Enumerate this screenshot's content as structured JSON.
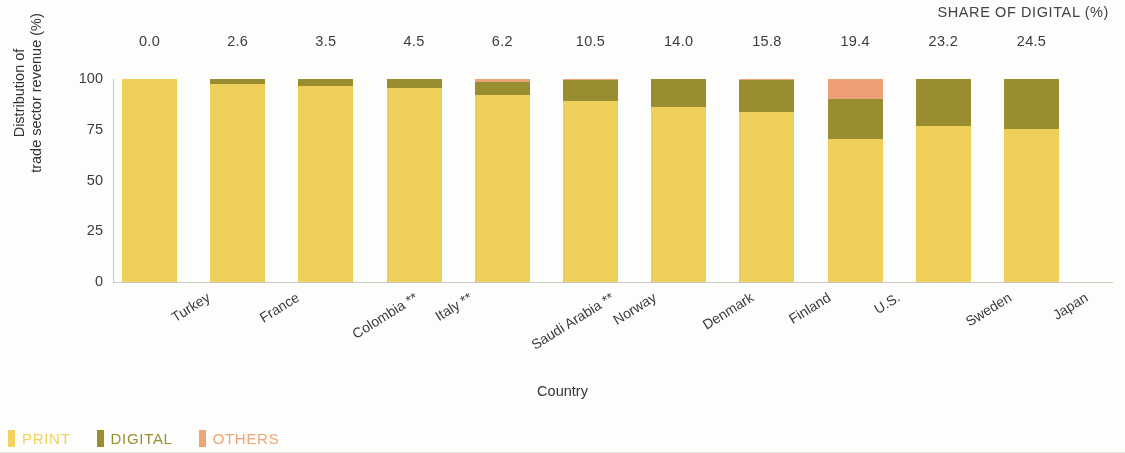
{
  "header": {
    "share_of_digital_label": "SHARE OF DIGITAL (%)"
  },
  "axes": {
    "y_title_line1": "Distribution of",
    "y_title_line2": "trade sector revenue (%)",
    "x_title": "Country",
    "y_ticks": [
      "100",
      "75",
      "50",
      "25",
      "0"
    ]
  },
  "legend": {
    "items": [
      {
        "label": "PRINT",
        "color": "#f1d25c",
        "name": "legend-print"
      },
      {
        "label": "DIGITAL",
        "color": "#9a8f30",
        "name": "legend-digital"
      },
      {
        "label": "OTHERS",
        "color": "#efa377",
        "name": "legend-others"
      }
    ]
  },
  "share_of_digital_values": [
    "0.0",
    "2.6",
    "3.5",
    "4.5",
    "6.2",
    "10.5",
    "14.0",
    "15.8",
    "19.4",
    "23.2",
    "24.5"
  ],
  "chart_data": {
    "type": "bar",
    "subtype": "stacked-bar-100",
    "title": "",
    "xlabel": "Country",
    "ylabel": "Distribution of trade sector revenue (%)",
    "ylim": [
      0,
      100
    ],
    "yticks": [
      0,
      25,
      50,
      75,
      100
    ],
    "grid": false,
    "legend_position": "bottom-left",
    "annotation_row_title": "SHARE OF DIGITAL (%)",
    "annotation_row_values": [
      0.0,
      2.6,
      3.5,
      4.5,
      6.2,
      10.5,
      14.0,
      15.8,
      19.4,
      23.2,
      24.5
    ],
    "categories": [
      "Turkey",
      "France",
      "Colombia **",
      "Italy **",
      "Saudi Arabia **",
      "Norway",
      "Denmark",
      "Finland",
      "U.S.",
      "Sweden",
      "Japan"
    ],
    "series": [
      {
        "name": "PRINT",
        "color": "#f1d25c",
        "values": [
          100.0,
          97.4,
          96.5,
          95.5,
          92.3,
          89.0,
          86.0,
          83.7,
          70.6,
          76.8,
          75.5
        ]
      },
      {
        "name": "DIGITAL",
        "color": "#9a8f30",
        "values": [
          0.0,
          2.6,
          3.5,
          4.5,
          6.2,
          10.5,
          14.0,
          15.8,
          19.4,
          23.2,
          24.5
        ]
      },
      {
        "name": "OTHERS",
        "color": "#efa377",
        "values": [
          0.0,
          0.0,
          0.0,
          0.0,
          1.5,
          0.5,
          0.0,
          0.5,
          10.0,
          0.0,
          0.0
        ]
      }
    ]
  }
}
